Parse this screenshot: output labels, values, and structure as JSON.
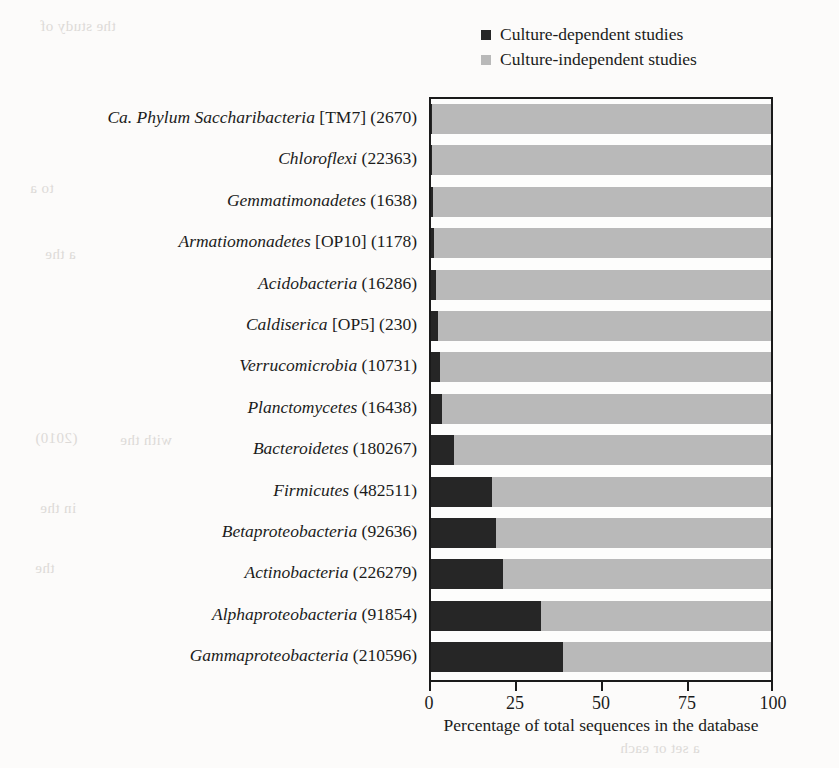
{
  "legend": {
    "items": [
      {
        "label": "Culture-dependent studies",
        "color": "#262626",
        "swatch_name": "legend-swatch-dependent"
      },
      {
        "label": "Culture-independent studies",
        "color": "#b9b9b9",
        "swatch_name": "legend-swatch-independent"
      }
    ]
  },
  "axis": {
    "x_title": "Percentage of total sequences in the database",
    "x_ticks": [
      "0",
      "25",
      "50",
      "75",
      "100"
    ]
  },
  "colors": {
    "dependent": "#262626",
    "independent": "#b9b9b9",
    "frame": "#1a1a1a",
    "background": "#fcfbfa"
  },
  "bleed_text": [
    {
      "text": "the study of",
      "x": 40,
      "y": 18
    },
    {
      "text": "in",
      "x": 700,
      "y": 120
    },
    {
      "text": "to a",
      "x": 30,
      "y": 180
    },
    {
      "text": "of the cultured",
      "x": 620,
      "y": 205
    },
    {
      "text": "a the",
      "x": 45,
      "y": 246
    },
    {
      "text": "the most",
      "x": 640,
      "y": 300
    },
    {
      "text": "(2010)",
      "x": 35,
      "y": 430
    },
    {
      "text": "with the",
      "x": 120,
      "y": 432
    },
    {
      "text": "and isolates",
      "x": 650,
      "y": 452
    },
    {
      "text": "in the",
      "x": 40,
      "y": 500
    },
    {
      "text": "culture",
      "x": 690,
      "y": 520
    },
    {
      "text": "the",
      "x": 35,
      "y": 560
    },
    {
      "text": "groups of",
      "x": 660,
      "y": 585
    },
    {
      "text": "a set or each",
      "x": 620,
      "y": 740
    }
  ],
  "chart_data": {
    "type": "bar",
    "orientation": "horizontal",
    "stacked": true,
    "title": "",
    "xlabel": "Percentage of total sequences in the database",
    "ylabel": "",
    "xlim": [
      0,
      100
    ],
    "xticks": [
      0,
      25,
      50,
      75,
      100
    ],
    "grid": false,
    "legend_position": "top-right",
    "categories": [
      {
        "name": "Ca. Phylum Saccharibacteria",
        "bracket": "[TM7]",
        "count": 2670,
        "label": "Ca. Phylum Saccharibacteria  [TM7] (2670)"
      },
      {
        "name": "Chloroflexi",
        "bracket": "",
        "count": 22363,
        "label": "Chloroflexi (22363)"
      },
      {
        "name": "Gemmatimonadetes",
        "bracket": "",
        "count": 1638,
        "label": "Gemmatimonadetes (1638)"
      },
      {
        "name": "Armatiomonadetes",
        "bracket": "[OP10]",
        "count": 1178,
        "label": "Armatiomonadetes [OP10] (1178)"
      },
      {
        "name": "Acidobacteria",
        "bracket": "",
        "count": 16286,
        "label": "Acidobacteria (16286)"
      },
      {
        "name": "Caldiserica",
        "bracket": "[OP5]",
        "count": 230,
        "label": "Caldiserica [OP5] (230)"
      },
      {
        "name": "Verrucomicrobia",
        "bracket": "",
        "count": 10731,
        "label": "Verrucomicrobia (10731)"
      },
      {
        "name": "Planctomycetes",
        "bracket": "",
        "count": 16438,
        "label": "Planctomycetes (16438)"
      },
      {
        "name": "Bacteroidetes",
        "bracket": "",
        "count": 180267,
        "label": "Bacteroidetes (180267)"
      },
      {
        "name": "Firmicutes",
        "bracket": "",
        "count": 482511,
        "label": "Firmicutes (482511)"
      },
      {
        "name": "Betaproteobacteria",
        "bracket": "",
        "count": 92636,
        "label": "Betaproteobacteria (92636)"
      },
      {
        "name": "Actinobacteria",
        "bracket": "",
        "count": 226279,
        "label": "Actinobacteria (226279)"
      },
      {
        "name": "Alphaproteobacteria",
        "bracket": "",
        "count": 91854,
        "label": "Alphaproteobacteria (91854)"
      },
      {
        "name": "Gammaproteobacteria",
        "bracket": "",
        "count": 210596,
        "label": "Gammaproteobacteria (210596)"
      }
    ],
    "series": [
      {
        "name": "Culture-dependent studies",
        "color": "#262626",
        "values": [
          0.3,
          0.4,
          0.7,
          0.9,
          1.5,
          2.0,
          2.6,
          3.2,
          6.7,
          18.0,
          19.0,
          21.2,
          32.3,
          38.7
        ]
      },
      {
        "name": "Culture-independent studies",
        "color": "#b9b9b9",
        "values": [
          99.7,
          99.6,
          99.3,
          99.1,
          98.5,
          98.0,
          97.4,
          96.8,
          93.3,
          82.0,
          81.0,
          78.8,
          67.7,
          61.3
        ]
      }
    ]
  }
}
